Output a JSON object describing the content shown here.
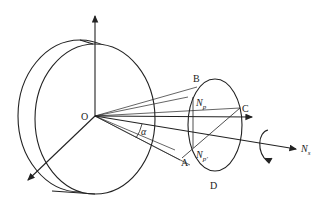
{
  "diagram": {
    "type": "geometric-schematic",
    "labels": {
      "origin": "O",
      "point_b": "B",
      "point_c": "C",
      "point_a": "A",
      "point_d": "D",
      "angle": "α",
      "np_main": "N",
      "np_sub": "p",
      "npp_main": "N",
      "npp_sub": "p'",
      "ns_main": "N",
      "ns_sub": "s"
    },
    "colors": {
      "stroke": "#222222",
      "background": "#ffffff"
    }
  }
}
